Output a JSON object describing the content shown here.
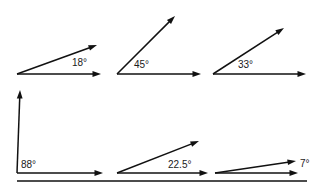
{
  "figure": {
    "background_color": "#ffffff",
    "stroke_color": "#111111",
    "label_color": "#1a1a1a",
    "label_font_size_px": 10,
    "rows": [
      {
        "name": "top-row",
        "baseline_y": 74,
        "has_shared_baseline": false,
        "angles": [
          {
            "id": "angle-18",
            "label": "18°",
            "value": 18,
            "unit": "degrees",
            "vertex": {
              "x": 17,
              "y": 74
            },
            "horizontal_ray_tip": {
              "x": 101,
              "y": 74
            },
            "slanted_ray_tip": {
              "x": 97,
              "y": 45
            },
            "label_pos": {
              "x": 72,
              "y": 66
            }
          },
          {
            "id": "angle-45",
            "label": "45°",
            "value": 45,
            "unit": "degrees",
            "vertex": {
              "x": 117,
              "y": 74
            },
            "horizontal_ray_tip": {
              "x": 201,
              "y": 74
            },
            "slanted_ray_tip": {
              "x": 175,
              "y": 16
            },
            "label_pos": {
              "x": 134,
              "y": 68
            }
          },
          {
            "id": "angle-33",
            "label": "33°",
            "value": 33,
            "unit": "degrees",
            "vertex": {
              "x": 213,
              "y": 74
            },
            "horizontal_ray_tip": {
              "x": 306,
              "y": 74
            },
            "slanted_ray_tip": {
              "x": 284,
              "y": 28
            },
            "label_pos": {
              "x": 238,
              "y": 68
            }
          }
        ]
      },
      {
        "name": "bottom-row",
        "baseline_y": 173,
        "has_shared_baseline": true,
        "shared_baseline": {
          "x1": 17,
          "x2": 307,
          "y": 181
        },
        "angles": [
          {
            "id": "angle-88",
            "label": "88°",
            "value": 88,
            "unit": "degrees",
            "vertex": {
              "x": 17,
              "y": 173
            },
            "horizontal_ray_tip": {
              "x": 103,
              "y": 173
            },
            "slanted_ray_tip": {
              "x": 20,
              "y": 90
            },
            "label_pos": {
              "x": 21,
              "y": 168
            }
          },
          {
            "id": "angle-22-5",
            "label": "22.5°",
            "value": 22.5,
            "unit": "degrees",
            "vertex": {
              "x": 117,
              "y": 173
            },
            "horizontal_ray_tip": {
              "x": 208,
              "y": 173
            },
            "slanted_ray_tip": {
              "x": 199,
              "y": 141
            },
            "label_pos": {
              "x": 168,
              "y": 168
            }
          },
          {
            "id": "angle-7",
            "label": "7°",
            "value": 7,
            "unit": "degrees",
            "vertex": {
              "x": 215,
              "y": 173
            },
            "horizontal_ray_tip": {
              "x": 298,
              "y": 173
            },
            "slanted_ray_tip": {
              "x": 296,
              "y": 161
            },
            "label_pos": {
              "x": 300,
              "y": 167
            }
          }
        ]
      }
    ]
  }
}
